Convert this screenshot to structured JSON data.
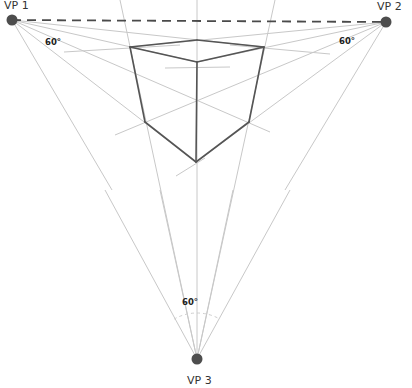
{
  "colors": {
    "background": "#ffffff",
    "guide": "#c8c8c8",
    "horizon": "#4a4a4a",
    "cube_edge": "#555555",
    "vanishing_point": "#4d4d4d",
    "label": "#333333"
  },
  "vanishing_points": [
    {
      "id": "vp1",
      "label": "VP 1",
      "x": 12,
      "y": 20,
      "label_x": 4,
      "label_y": 9
    },
    {
      "id": "vp2",
      "label": "VP 2",
      "x": 386,
      "y": 22,
      "label_x": 377,
      "label_y": 10
    },
    {
      "id": "vp3",
      "label": "VP 3",
      "x": 197,
      "y": 359,
      "label_x": 187,
      "label_y": 384
    }
  ],
  "horizon_line": {
    "x1": 12,
    "y1": 20,
    "x2": 386,
    "y2": 22,
    "style": "dashed"
  },
  "angle_labels": [
    {
      "id": "angle-vp1",
      "text": "60°",
      "x": 45,
      "y": 45
    },
    {
      "id": "angle-vp2",
      "text": "60°",
      "x": 339,
      "y": 44
    },
    {
      "id": "angle-vp3",
      "text": "60°",
      "x": 182,
      "y": 305
    }
  ],
  "cube": {
    "vertices": {
      "top_back": [
        197,
        40
      ],
      "top_left": [
        130,
        47
      ],
      "top_right": [
        264,
        47
      ],
      "top_front": [
        197,
        62
      ],
      "bottom_left": [
        145,
        122
      ],
      "bottom_right": [
        249,
        122
      ],
      "bottom_front": [
        196,
        162
      ]
    },
    "edges": [
      [
        "top_back",
        "top_left"
      ],
      [
        "top_back",
        "top_right"
      ],
      [
        "top_left",
        "top_front"
      ],
      [
        "top_right",
        "top_front"
      ],
      [
        "top_left",
        "bottom_left"
      ],
      [
        "top_right",
        "bottom_right"
      ],
      [
        "top_front",
        "bottom_front"
      ],
      [
        "bottom_left",
        "bottom_front"
      ],
      [
        "bottom_right",
        "bottom_front"
      ]
    ]
  },
  "guide_lines": [
    {
      "x1": 12,
      "y1": 20,
      "x2": 264,
      "y2": 47
    },
    {
      "x1": 12,
      "y1": 20,
      "x2": 197,
      "y2": 62
    },
    {
      "x1": 12,
      "y1": 20,
      "x2": 270,
      "y2": 132
    },
    {
      "x1": 12,
      "y1": 20,
      "x2": 196,
      "y2": 162
    },
    {
      "x1": 12,
      "y1": 20,
      "x2": 112,
      "y2": 190
    },
    {
      "x1": 386,
      "y1": 22,
      "x2": 130,
      "y2": 47
    },
    {
      "x1": 386,
      "y1": 22,
      "x2": 197,
      "y2": 62
    },
    {
      "x1": 386,
      "y1": 22,
      "x2": 115,
      "y2": 135
    },
    {
      "x1": 386,
      "y1": 22,
      "x2": 196,
      "y2": 162
    },
    {
      "x1": 386,
      "y1": 22,
      "x2": 285,
      "y2": 190
    },
    {
      "x1": 197,
      "y1": 359,
      "x2": 120,
      "y2": 0
    },
    {
      "x1": 197,
      "y1": 359,
      "x2": 197,
      "y2": 0
    },
    {
      "x1": 197,
      "y1": 359,
      "x2": 275,
      "y2": 0
    },
    {
      "x1": 197,
      "y1": 359,
      "x2": 105,
      "y2": 190
    },
    {
      "x1": 197,
      "y1": 359,
      "x2": 290,
      "y2": 190
    },
    {
      "x1": 197,
      "y1": 359,
      "x2": 160,
      "y2": 190
    },
    {
      "x1": 197,
      "y1": 359,
      "x2": 233,
      "y2": 190
    },
    {
      "x1": 64,
      "y1": 52,
      "x2": 180,
      "y2": 45
    },
    {
      "x1": 230,
      "y1": 45,
      "x2": 330,
      "y2": 54
    },
    {
      "x1": 165,
      "y1": 68,
      "x2": 230,
      "y2": 67
    },
    {
      "x1": 176,
      "y1": 176,
      "x2": 205,
      "y2": 158
    }
  ],
  "arc_vp3": {
    "cx": 197,
    "cy": 359,
    "r": 46,
    "start_deg": 240,
    "end_deg": 300
  }
}
